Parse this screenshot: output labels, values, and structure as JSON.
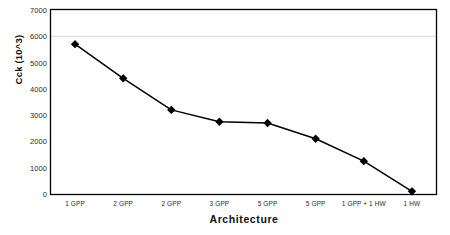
{
  "chart_data": {
    "type": "line",
    "title": "",
    "xlabel": "Architecture",
    "ylabel": "Cck (10^3)",
    "categories": [
      "1 GPP",
      "2 GPP",
      "2 GPP",
      "3 GPP",
      "5 GPP",
      "5 GPP",
      "1 GPP + 1 HW",
      "1 HW"
    ],
    "values": [
      5700,
      4400,
      3200,
      2750,
      2700,
      2100,
      1250,
      100
    ],
    "series": [
      {
        "name": "Cck",
        "values": [
          5700,
          4400,
          3200,
          2750,
          2700,
          2100,
          1250,
          100
        ],
        "marker": "diamond",
        "marker_color": "#000000",
        "line_color": "#000000"
      }
    ],
    "ylim": [
      0,
      7000
    ],
    "ytick_labels": [
      "7000",
      "6000",
      "5000",
      "4000",
      "3000",
      "2000",
      "1000",
      "0"
    ],
    "ytick_values": [
      7000,
      6000,
      5000,
      4000,
      3000,
      2000,
      1000,
      0
    ],
    "grid": "horizontal-single-at-6000",
    "gridline_values": [
      6000
    ],
    "legend": "none",
    "legend_position": "none",
    "plot_border": true,
    "background_color": "#ffffff",
    "axis_color": "#000000",
    "gridline_color": "#d9d9d9"
  }
}
